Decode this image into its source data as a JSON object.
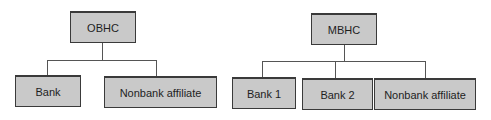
{
  "diagrams": [
    {
      "name": "OBHC structure",
      "root": {
        "label": "OBHC"
      },
      "children": [
        {
          "label": "Bank"
        },
        {
          "label": "Nonbank affiliate"
        }
      ]
    },
    {
      "name": "MBHC structure",
      "root": {
        "label": "MBHC"
      },
      "children": [
        {
          "label": "Bank 1"
        },
        {
          "label": "Bank 2"
        },
        {
          "label": "Nonbank affiliate"
        }
      ]
    }
  ],
  "colors": {
    "box_fill": "#c9c9c9",
    "box_border": "#3a3a3a",
    "connector": "#555555",
    "background": "#ffffff"
  }
}
